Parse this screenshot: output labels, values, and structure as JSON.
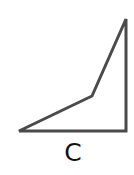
{
  "diagram": {
    "shape": {
      "label": "C",
      "type": "polygon",
      "vertices": [
        [
          126,
          19
        ],
        [
          126,
          131
        ],
        [
          19,
          131
        ],
        [
          92,
          96
        ]
      ],
      "stroke_color": "#4a4a4a",
      "stroke_width": 3,
      "fill": "#ffffff"
    }
  }
}
